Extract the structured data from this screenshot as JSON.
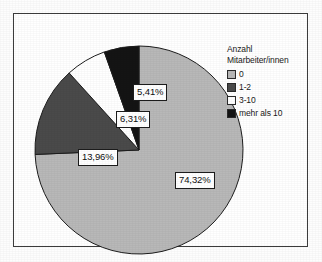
{
  "chart_data": {
    "type": "pie",
    "title": "",
    "subtitle": "",
    "xlabel": "",
    "ylabel": "",
    "grid": false,
    "legend_position": "right",
    "legend_title_lines": [
      "Anzahl",
      "Mitarbeiter/innen"
    ],
    "start_angle_deg": 0,
    "direction": "clockwise",
    "categories": [
      "0",
      "1-2",
      "3-10",
      "mehr als 10"
    ],
    "values": [
      74.32,
      13.96,
      6.31,
      5.41
    ],
    "value_unit": "%",
    "data_labels": [
      "74,32%",
      "13,96%",
      "6,31%",
      "5,41%"
    ],
    "colors": [
      "#b8b8b8",
      "#4a4a4a",
      "#ffffff",
      "#141414"
    ],
    "slice_border_color": "#1c1c1c",
    "slices": [
      {
        "category": "0",
        "value": 74.32,
        "label": "74,32%",
        "color": "#b8b8b8"
      },
      {
        "category": "1-2",
        "value": 13.96,
        "label": "13,96%",
        "color": "#4a4a4a"
      },
      {
        "category": "3-10",
        "value": 6.31,
        "label": "6,31%",
        "color": "#ffffff"
      },
      {
        "category": "mehr als 10",
        "value": 5.41,
        "label": "5,41%",
        "color": "#141414"
      }
    ]
  },
  "legend": {
    "title_line_1": "Anzahl",
    "title_line_2": "Mitarbeiter/innen",
    "items": [
      {
        "label": "0",
        "color": "#b8b8b8"
      },
      {
        "label": "1-2",
        "color": "#4a4a4a"
      },
      {
        "label": "3-10",
        "color": "#ffffff"
      },
      {
        "label": "mehr als 10",
        "color": "#141414"
      }
    ]
  },
  "labels": {
    "slice_0": "74,32%",
    "slice_1": "13,96%",
    "slice_2": "6,31%",
    "slice_3": "5,41%"
  },
  "theme": {
    "background": "#ffffff",
    "frame_border": "#3c3c3c",
    "text": "#1a1a1a"
  }
}
